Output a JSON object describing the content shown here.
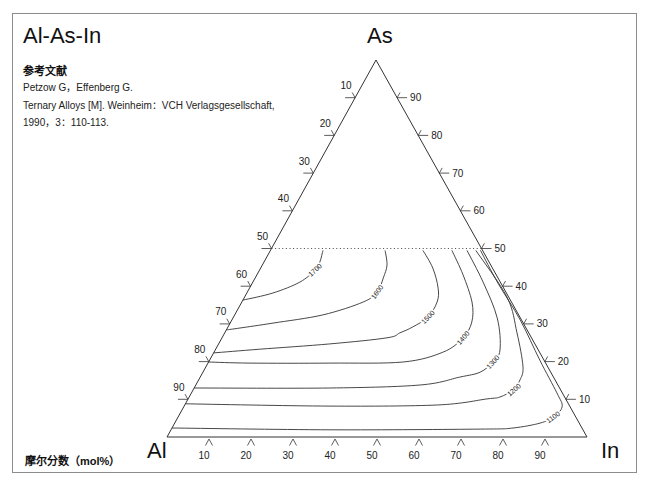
{
  "header": {
    "title": "Al-As-In"
  },
  "reference": {
    "heading": "参考文献",
    "lines": [
      "Petzow G，Effenberg G.",
      "Ternary Alloys [M]. Weinheim：VCH Verlagsgesellschaft,",
      "1990，3：110-113."
    ]
  },
  "footer": {
    "unit_label": "摩尔分数（mol%）"
  },
  "colors": {
    "line": "#333333",
    "frame": "#8c8c8c",
    "text": "#111111"
  },
  "chart_data": {
    "type": "ternary-contour",
    "title": "Al-As-In",
    "vertices": {
      "top": "As",
      "left": "Al",
      "right": "In"
    },
    "unit": "mol%",
    "axes": {
      "left_edge": {
        "component": "Al",
        "ticks": [
          10,
          20,
          30,
          40,
          50,
          60,
          70,
          80,
          90
        ]
      },
      "right_edge": {
        "component": "As",
        "ticks": [
          90,
          80,
          70,
          60,
          50,
          40,
          30,
          20,
          10
        ]
      },
      "bottom_edge": {
        "component": "In",
        "ticks": [
          10,
          20,
          30,
          40,
          50,
          60,
          70,
          80,
          90
        ]
      }
    },
    "boundary_line": {
      "style": "dotted",
      "As": 50
    },
    "point_format": [
      "In_mol%",
      "As_mol%"
    ],
    "isotherms": [
      {
        "value": 1700,
        "points": [
          [
            12.5,
            49.5
          ],
          [
            13.3,
            46.4
          ],
          [
            13.2,
            44.3
          ],
          [
            11.2,
            41.1
          ],
          [
            6.2,
            38.2
          ],
          [
            0,
            36.3
          ]
        ],
        "label": {
          "at": [
            13.2,
            44.3
          ],
          "angle": -42
        }
      },
      {
        "value": 1600,
        "points": [
          [
            27.3,
            49.5
          ],
          [
            29.7,
            45.6
          ],
          [
            30.5,
            42.2
          ],
          [
            30.9,
            38.5
          ],
          [
            28.9,
            35.8
          ],
          [
            21.0,
            32.4
          ],
          [
            10.2,
            30.2
          ],
          [
            3.0,
            28.9
          ],
          [
            0,
            28.4
          ]
        ],
        "label": {
          "at": [
            30.9,
            38.5
          ],
          "angle": -55
        }
      },
      {
        "value": 1500,
        "points": [
          [
            36.3,
            49.5
          ],
          [
            41.0,
            44.8
          ],
          [
            44.9,
            39.5
          ],
          [
            46.5,
            35.8
          ],
          [
            46.3,
            31.8
          ],
          [
            44.0,
            29.2
          ],
          [
            41.7,
            27.6
          ],
          [
            39.3,
            26.3
          ],
          [
            26.5,
            24.7
          ],
          [
            10.5,
            23.3
          ],
          [
            0,
            22.3
          ]
        ],
        "label": {
          "at": [
            46.3,
            31.8
          ],
          "angle": -46
        }
      },
      {
        "value": 1400,
        "points": [
          [
            43.2,
            49.5
          ],
          [
            49.1,
            43.0
          ],
          [
            54.8,
            35.8
          ],
          [
            57.4,
            30.5
          ],
          [
            57.4,
            26.3
          ],
          [
            54.5,
            22.5
          ],
          [
            46.3,
            19.9
          ],
          [
            29.0,
            19.6
          ],
          [
            10.0,
            19.6
          ],
          [
            0,
            19.9
          ]
        ],
        "label": {
          "at": [
            57.4,
            26.3
          ],
          "angle": -50
        }
      },
      {
        "value": 1300,
        "points": [
          [
            46.8,
            49.5
          ],
          [
            54.8,
            41.1
          ],
          [
            62.9,
            31.6
          ],
          [
            67.8,
            23.1
          ],
          [
            67.7,
            19.9
          ],
          [
            66.0,
            17.2
          ],
          [
            61.8,
            15.9
          ],
          [
            53.4,
            13.8
          ],
          [
            32.3,
            13.0
          ],
          [
            0,
            13.0
          ]
        ],
        "label": {
          "at": [
            67.7,
            19.9
          ],
          "angle": -48
        }
      },
      {
        "value": 1200,
        "points": [
          [
            48.9,
            49.5
          ],
          [
            62.5,
            37.1
          ],
          [
            69.6,
            27.6
          ],
          [
            75.5,
            18.6
          ],
          [
            76.5,
            15.1
          ],
          [
            76.2,
            12.5
          ],
          [
            74.0,
            10.6
          ],
          [
            71.2,
            10.1
          ],
          [
            60.1,
            8.5
          ],
          [
            34.7,
            8.2
          ],
          [
            0,
            8.8
          ]
        ],
        "label": {
          "at": [
            76.4,
            12.5
          ],
          "angle": -40
        }
      },
      {
        "value": 1100,
        "points": [
          [
            50.0,
            49.5
          ],
          [
            58.5,
            40.8
          ],
          [
            68.7,
            31.0
          ],
          [
            78.6,
            20.4
          ],
          [
            87.0,
            11.7
          ],
          [
            90.1,
            8.0
          ],
          [
            89.3,
            5.3
          ],
          [
            87.0,
            3.7
          ],
          [
            81.2,
            2.4
          ],
          [
            73.5,
            2.1
          ],
          [
            37.9,
            1.9
          ],
          [
            0,
            2.4
          ]
        ],
        "label": {
          "at": [
            89.3,
            5.3
          ],
          "angle": -36
        }
      }
    ]
  }
}
